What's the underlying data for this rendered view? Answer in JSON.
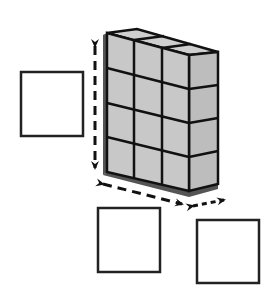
{
  "diagram": {
    "cubes": {
      "columns": 3,
      "rows": 4,
      "depth": 1
    },
    "answer_boxes": [
      {
        "id": "height-box",
        "label": "",
        "measures": "height"
      },
      {
        "id": "length-box",
        "label": "",
        "measures": "length"
      },
      {
        "id": "width-box",
        "label": "",
        "measures": "width"
      }
    ],
    "colors": {
      "cube_fill": "#c8c8c8",
      "cube_side_fill": "#bdbdbd",
      "edge": "#111111",
      "shadow": "#555555",
      "box_border": "#222222"
    }
  }
}
